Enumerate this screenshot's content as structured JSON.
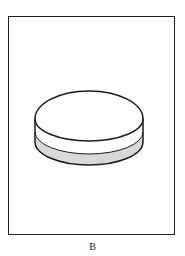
{
  "figure": {
    "label": "B",
    "object": "cylinder-disc",
    "colors": {
      "outline": "#1a1a1a",
      "top_face": "#ffffff",
      "upper_band": "#ffffff",
      "lower_band": "#d9d9d9",
      "background": "#ffffff"
    }
  }
}
